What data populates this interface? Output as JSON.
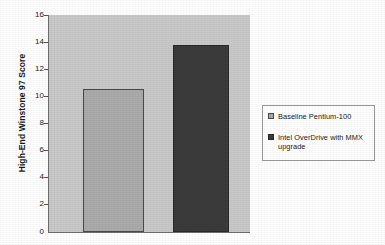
{
  "chart_data": {
    "type": "bar",
    "title": "",
    "xlabel": "",
    "ylabel": "High-End Winstone 97 Score",
    "ylim": [
      0,
      16
    ],
    "ytick_labels": [
      "16",
      "14",
      "12",
      "10",
      "8",
      "6",
      "4",
      "2",
      "0"
    ],
    "ytick_values": [
      16,
      14,
      12,
      10,
      8,
      6,
      4,
      2,
      0
    ],
    "grid": false,
    "legend_position": "right",
    "categories": [
      "Baseline Pentium-100",
      "Intel OverDrive with MMX upgrade"
    ],
    "values": [
      10.5,
      13.7
    ],
    "series": [
      {
        "name": "Baseline Pentium-100",
        "value": 10.5,
        "color": "#ababab"
      },
      {
        "name": "Intel OverDrive with MMX upgrade",
        "value": 13.7,
        "color": "#3b3b3b"
      }
    ]
  },
  "legend": {
    "entries": [
      {
        "label": "Baseline Pentium-100"
      },
      {
        "label": "Intel OverDrive with MMX upgrade"
      }
    ]
  },
  "colors": {
    "plot_background": "#c9c9c9",
    "page_background": "#ffffff",
    "axis": "#6e6e6e",
    "bar_baseline": "#ababab",
    "bar_overdrive": "#3b3b3b"
  }
}
